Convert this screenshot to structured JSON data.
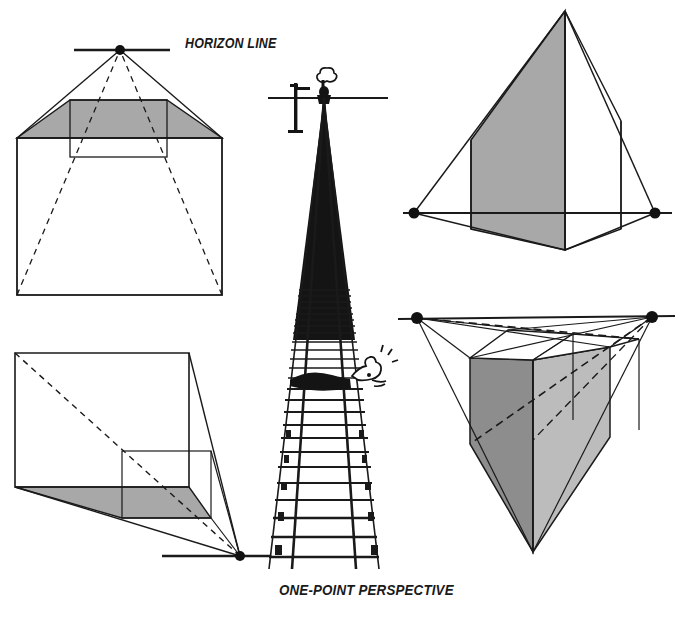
{
  "figure": {
    "title": "ONE-POINT PERSPECTIVE",
    "horizon_label": "HORIZON LINE",
    "background": "#ffffff",
    "ink": "#1a1a1a",
    "fills": {
      "mid_gray": "#a8a8a8",
      "dark_gray": "#8d8d8d",
      "light_gray": "#bcbcbc"
    }
  },
  "panels": [
    {
      "name": "one-point-box-above-horizon",
      "position": "top-left",
      "vanishing_points": 1,
      "vanishing_point": [
        120,
        50
      ],
      "horizon_y": 50,
      "shaded_face": "top",
      "description": "Cube below the horizon line with a single vanishing point on the horizon; the top plane is shaded gray and receding edges are dashed."
    },
    {
      "name": "one-point-box-left-of-horizon",
      "position": "bottom-left",
      "vanishing_points": 1,
      "vanishing_point": [
        240,
        557
      ],
      "horizon_y": 557,
      "shaded_face": "bottom",
      "description": "Cube above the horizon with the vanishing point at lower right; the floor plane is shaded gray and one diagonal is dashed."
    },
    {
      "name": "railroad-track-perspective",
      "position": "center",
      "vanishing_points": 1,
      "vanishing_point": [
        324,
        98
      ],
      "horizon_y": 98,
      "description": "Railroad track receding to a single vanishing point on the horizon, with a telegraph pole, an approaching locomotive with smoke, and a cartoon figure tied to the rails."
    },
    {
      "name": "two-point-form-below-horizon",
      "position": "top-right",
      "vanishing_points": 2,
      "vanishing_point_left": [
        414,
        213
      ],
      "vanishing_point_right": [
        655,
        213
      ],
      "horizon_y": 213,
      "shaded_face": "left",
      "description": "Tall two-point perspective form seen from below; horizon passes through its base and the left face is shaded gray."
    },
    {
      "name": "two-point-form-above-horizon",
      "position": "bottom-right",
      "vanishing_points": 2,
      "vanishing_point_left": [
        417,
        318
      ],
      "vanishing_point_right": [
        652,
        317
      ],
      "horizon_y": 318,
      "shaded_faces": [
        "left",
        "right"
      ],
      "description": "Two-point perspective box seen from above with converging construction lines to both vanishing points; left face dark gray, right face light gray."
    }
  ]
}
